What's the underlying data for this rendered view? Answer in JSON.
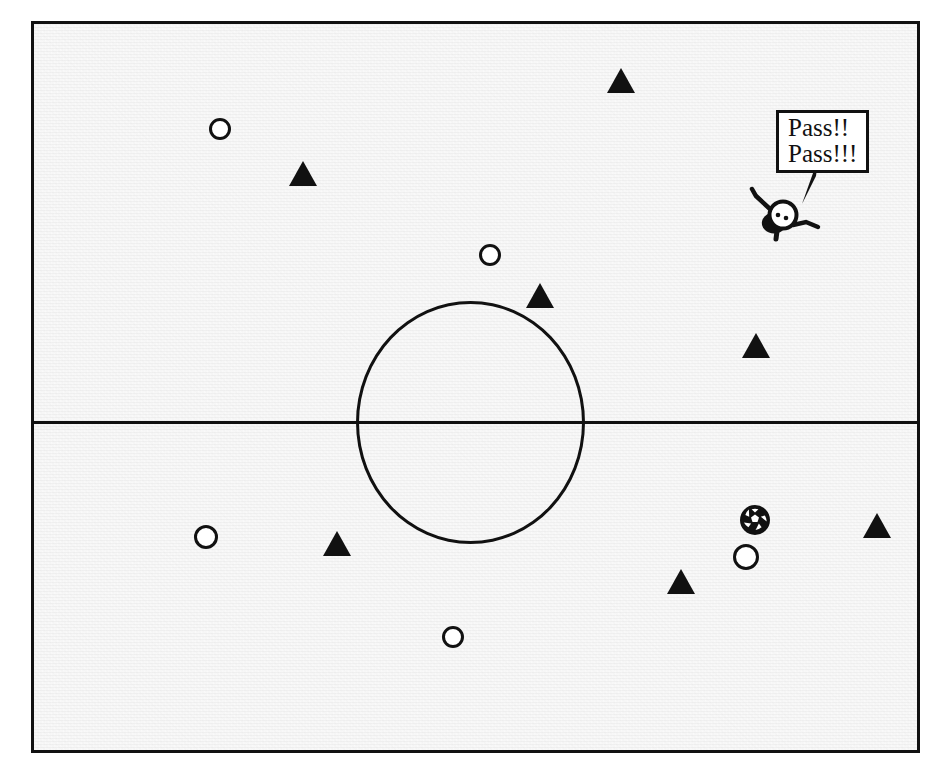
{
  "scene": {
    "title": "Soccer pitch diagram with players and ball",
    "width": 946,
    "height": 776,
    "background_color": "#ffffff",
    "pitch_fill_color": "#f2f2f2",
    "line_color": "#111111"
  },
  "pitch": {
    "name": "soccer-field",
    "border_label": "field-boundary",
    "halfway_line_label": "halfway-line",
    "center_circle_label": "center-circle"
  },
  "speech_bubble": {
    "line1": "Pass!!",
    "line2": "Pass!!!"
  },
  "character": {
    "label": "shouting-player-figure",
    "eyes": 2
  },
  "ball": {
    "label": "soccer-ball"
  },
  "legend": {
    "circle_team": "white-circle-player",
    "triangle_team": "black-triangle-player"
  },
  "players": [
    {
      "id": "circle-1",
      "shape": "circle",
      "x": 213,
      "y": 126,
      "r": 11
    },
    {
      "id": "circle-2",
      "shape": "circle",
      "x": 483,
      "y": 252,
      "r": 11
    },
    {
      "id": "circle-3",
      "shape": "circle",
      "x": 199,
      "y": 534,
      "r": 12
    },
    {
      "id": "circle-4",
      "shape": "circle",
      "x": 446,
      "y": 634,
      "r": 11
    },
    {
      "id": "circle-5",
      "shape": "circle",
      "x": 739,
      "y": 554,
      "r": 13
    },
    {
      "id": "triangle-1",
      "shape": "triangle",
      "x": 618,
      "y": 77
    },
    {
      "id": "triangle-2",
      "shape": "triangle",
      "x": 300,
      "y": 170
    },
    {
      "id": "triangle-3",
      "shape": "triangle",
      "x": 537,
      "y": 292
    },
    {
      "id": "triangle-4",
      "shape": "triangle",
      "x": 753,
      "y": 342
    },
    {
      "id": "triangle-5",
      "shape": "triangle",
      "x": 334,
      "y": 540
    },
    {
      "id": "triangle-6",
      "shape": "triangle",
      "x": 874,
      "y": 522
    },
    {
      "id": "triangle-7",
      "shape": "triangle",
      "x": 678,
      "y": 578
    }
  ]
}
